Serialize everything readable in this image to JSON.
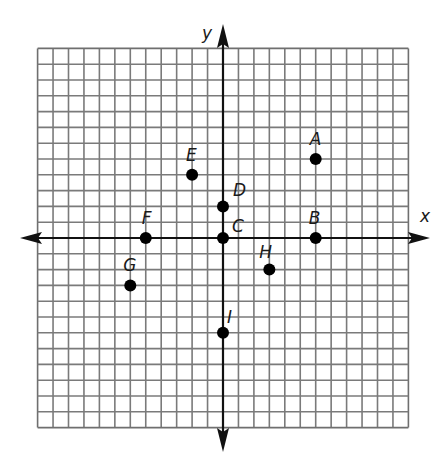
{
  "diagram": {
    "type": "coordinate-plane",
    "grid": {
      "xmin": -12,
      "xmax": 12,
      "ymin": -12,
      "ymax": 12,
      "step": 1,
      "line_color": "#7a7a7a",
      "border_color": "#6f6f6f"
    },
    "axes": {
      "x_label": "x",
      "y_label": "y",
      "color": "#111111"
    },
    "points": [
      {
        "label": "A",
        "x": 6,
        "y": 5
      },
      {
        "label": "B",
        "x": 6,
        "y": 0
      },
      {
        "label": "C",
        "x": 0,
        "y": 0
      },
      {
        "label": "D",
        "x": 0,
        "y": 2
      },
      {
        "label": "E",
        "x": -2,
        "y": 4
      },
      {
        "label": "F",
        "x": -5,
        "y": 0
      },
      {
        "label": "G",
        "x": -6,
        "y": -3
      },
      {
        "label": "H",
        "x": 3,
        "y": -2
      },
      {
        "label": "I",
        "x": 0,
        "y": -6
      }
    ],
    "point_color": "#000000"
  }
}
